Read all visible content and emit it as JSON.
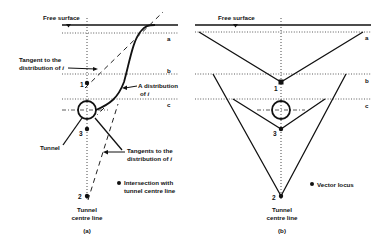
{
  "panel_a": {
    "caption": "(a)",
    "free_surface": "Free surface",
    "levels": [
      "a",
      "b",
      "c"
    ],
    "tangent_label_line1": "Tangent to the",
    "tangent_label_line2": "distribution of ",
    "tangent_label_var": "i",
    "distribution_label_line1": "A distribution",
    "distribution_label_line2": "of ",
    "distribution_label_var": "i",
    "tunnel_label": "Tunnel",
    "tangents_label_line1": "Tangents to the",
    "tangents_label_line2": "distribution of ",
    "tangents_label_var": "i",
    "legend_line1": "Intersection with",
    "legend_line2": "tunnel centre line",
    "centre_line_line1": "Tunnel",
    "centre_line_line2": "centre line",
    "points": [
      "1",
      "3",
      "2"
    ]
  },
  "panel_b": {
    "caption": "(b)",
    "free_surface": "Free surface",
    "levels": [
      "a",
      "b",
      "c"
    ],
    "legend": "Vector locus",
    "centre_line_line1": "Tunnel",
    "centre_line_line2": "centre line",
    "points": [
      "1",
      "3",
      "2"
    ]
  }
}
